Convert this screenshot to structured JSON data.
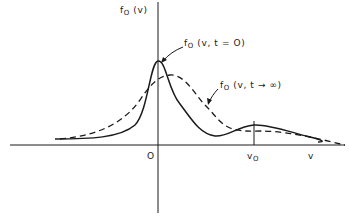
{
  "axes": {
    "y_label_main": "f",
    "y_label_sub": "O",
    "y_label_arg": " (v)",
    "x_label": "v",
    "origin_label": "O",
    "v0_label_main": "v",
    "v0_label_sub": "O"
  },
  "curves": [
    {
      "name": "initial",
      "label_main": "f",
      "label_sub": "O",
      "label_arg": " (v, t = O)",
      "style": "solid"
    },
    {
      "name": "asymptotic",
      "label_main": "f",
      "label_sub": "O",
      "label_arg": " (v, t → ∞)",
      "style": "dashed"
    }
  ],
  "colors": {
    "ink": "#1a1a1a",
    "background": "#ffffff"
  }
}
